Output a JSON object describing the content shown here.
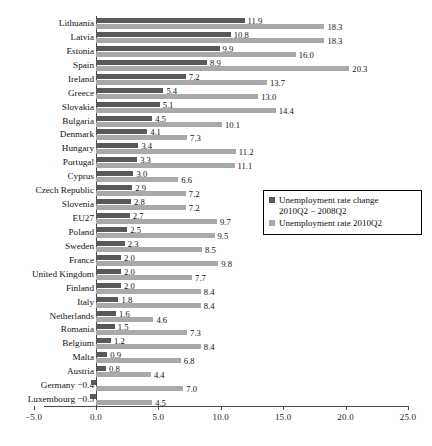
{
  "chart_data": {
    "type": "bar",
    "orientation": "horizontal",
    "title": "",
    "xlabel": "",
    "ylabel": "",
    "xlim": [
      -5.0,
      25.0
    ],
    "xticks": [
      "-5.0",
      "0.0",
      "5.0",
      "10.0",
      "15.0",
      "20.0",
      "25.0"
    ],
    "grid": false,
    "legend_position": "center-right",
    "series": [
      {
        "name": "Unemployment rate change 2010Q2 - 2008Q2",
        "color": "#59595b",
        "values": [
          11.9,
          10.8,
          9.9,
          8.9,
          7.2,
          5.4,
          5.1,
          4.5,
          4.1,
          3.4,
          3.3,
          3.0,
          2.9,
          2.8,
          2.7,
          2.5,
          2.3,
          2.0,
          2.0,
          2.0,
          1.8,
          1.6,
          1.5,
          1.2,
          0.9,
          0.8,
          -0.4,
          -0.5
        ]
      },
      {
        "name": "Unemployment rate 2010Q2",
        "color": "#a9a9a9",
        "values": [
          18.3,
          18.3,
          16.0,
          20.3,
          13.7,
          13.0,
          14.4,
          10.1,
          7.3,
          11.2,
          11.1,
          6.6,
          7.2,
          7.2,
          9.7,
          9.5,
          8.5,
          9.8,
          7.7,
          8.4,
          8.4,
          4.6,
          7.3,
          8.4,
          6.8,
          4.4,
          7.0,
          4.5
        ]
      }
    ],
    "categories": [
      "Lithuania",
      "Latvia",
      "Estonia",
      "Spain",
      "Ireland",
      "Greece",
      "Slovakia",
      "Bulgaria",
      "Denmark",
      "Hungary",
      "Portugal",
      "Cyprus",
      "Czech Republic",
      "Slovenia",
      "EU27",
      "Poland",
      "Sweden",
      "France",
      "United Kingdom",
      "Finland",
      "Italy",
      "Netherlands",
      "Romania",
      "Belgium",
      "Malta",
      "Austria",
      "Germany",
      "Luxembourg"
    ],
    "change_labels": [
      "11.9",
      "10.8",
      "9.9",
      "8.9",
      "7.2",
      "5.4",
      "5.1",
      "4.5",
      "4.1",
      "3.4",
      "3.3",
      "3.0",
      "2.9",
      "2.8",
      "2.7",
      "2.5",
      "2.3",
      "2.0",
      "2.0",
      "2.0",
      "1.8",
      "1.6",
      "1.5",
      "1.2",
      "0.9",
      "0.8",
      "-0.4",
      "-0.5"
    ],
    "rate_labels": [
      "18.3",
      "18.3",
      "16.0",
      "20.3",
      "13.7",
      "13.0",
      "14.4",
      "10.1",
      "7.3",
      "11.2",
      "11.1",
      "6.6",
      "7.2",
      "7.2",
      "9.7",
      "9.5",
      "8.5",
      "9.8",
      "7.7",
      "8.4",
      "8.4",
      "4.6",
      "7.3",
      "8.4",
      "6.8",
      "4.4",
      "7.0",
      "4.5"
    ]
  },
  "legend": {
    "items": [
      {
        "line1": "Unemployment rate change",
        "line2": "2010Q2 − 2008Q2"
      },
      {
        "line1": "Unemployment rate 2010Q2",
        "line2": ""
      }
    ]
  }
}
